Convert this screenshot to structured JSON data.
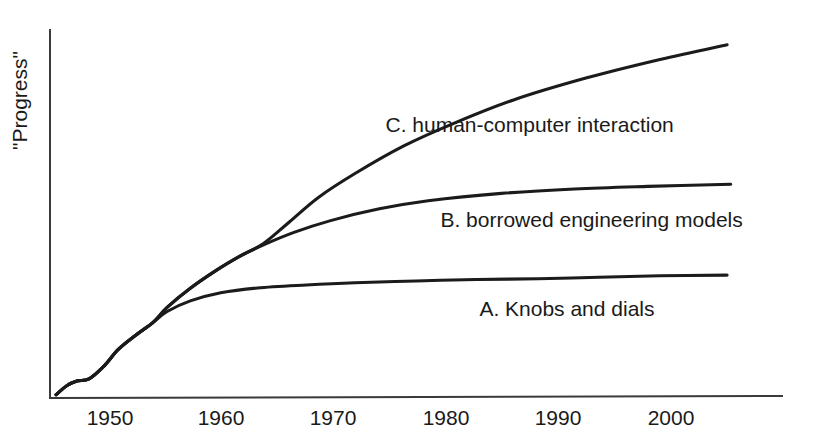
{
  "chart_data": {
    "type": "line",
    "title": "",
    "xlabel": "",
    "ylabel": "\"Progress\"",
    "xlim": [
      1945,
      2005
    ],
    "ylim": [
      0,
      100
    ],
    "grid": false,
    "legend_position": "inline-right-of-curve",
    "axis_ticks_shown": false,
    "x_tick_labels": [
      "1950",
      "1960",
      "1970",
      "1980",
      "1990",
      "2000"
    ],
    "y_tick_labels": [],
    "series": [
      {
        "name": "A. Knobs and dials",
        "label": "A. Knobs and dials",
        "key": "A",
        "x": [
          1945.5,
          1946.4,
          1947.2,
          1948.2,
          1949.4,
          1950.6,
          1952.0,
          1953.4,
          1954.6,
          1956.5,
          1959.0,
          1962.0,
          1966.0,
          1970.0,
          1975.0,
          1980.0,
          1985.0,
          1990.0,
          1995.0,
          2000.5
        ],
        "values": [
          0.9,
          3.4,
          4.6,
          5.2,
          8.6,
          13.2,
          17.0,
          20.4,
          23.5,
          26.4,
          28.6,
          29.9,
          30.7,
          31.3,
          31.8,
          32.2,
          32.4,
          32.8,
          33.2,
          33.4
        ],
        "label_x": 1980.2,
        "label_y": 24.0
      },
      {
        "name": "B. borrowed engineering models",
        "label": "B. borrowed engineering models",
        "key": "B",
        "x": [
          1945.5,
          1946.4,
          1947.2,
          1948.2,
          1949.4,
          1950.6,
          1952.0,
          1953.4,
          1954.6,
          1956.5,
          1958.5,
          1960.5,
          1962.5,
          1965.0,
          1968.0,
          1972.0,
          1976.0,
          1982.0,
          1988.0,
          1994.0,
          2000.8
        ],
        "values": [
          0.9,
          3.4,
          4.6,
          5.2,
          8.6,
          13.2,
          17.0,
          20.4,
          24.6,
          29.8,
          34.4,
          38.4,
          41.6,
          45.0,
          48.2,
          51.4,
          53.6,
          55.6,
          56.8,
          57.5,
          58.1
        ],
        "label_x": 1977.0,
        "label_y": 48.0
      },
      {
        "name": "C. human-computer interaction",
        "label": "C. human-computer interaction",
        "key": "C",
        "x": [
          1945.5,
          1946.4,
          1947.2,
          1948.2,
          1949.4,
          1950.6,
          1952.0,
          1953.4,
          1954.6,
          1956.5,
          1958.5,
          1960.5,
          1962.5,
          1964.5,
          1967.0,
          1970.0,
          1974.0,
          1978.0,
          1983.0,
          1989.0,
          1995.0,
          2000.5
        ],
        "values": [
          0.9,
          3.4,
          4.6,
          5.2,
          8.6,
          13.2,
          17.0,
          20.4,
          24.6,
          29.8,
          34.4,
          38.4,
          42.0,
          47.5,
          54.5,
          61.0,
          68.5,
          74.5,
          81.0,
          87.0,
          92.0,
          96.0
        ],
        "label_x": 1972.5,
        "label_y": 74.0
      }
    ]
  },
  "axes": {
    "y_axis_name": "y-axis",
    "x_axis_name": "x-axis"
  },
  "ylabel_text": "\"Progress\""
}
